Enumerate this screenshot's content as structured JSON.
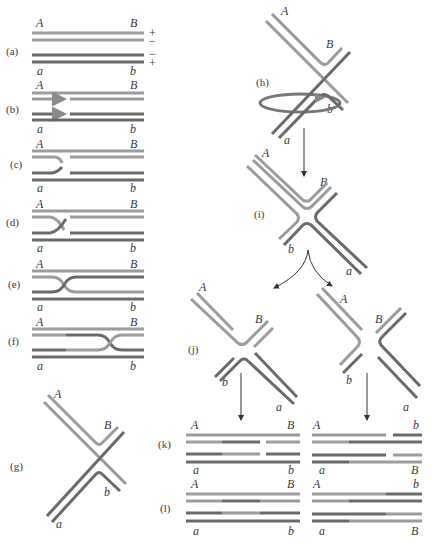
{
  "figure": {
    "colors": {
      "light_strand": "#9c9c9c",
      "dark_strand": "#6a6a6a",
      "arrow": "#333333",
      "background": "#ffffff"
    },
    "panels": {
      "a": {
        "label": "(a)",
        "top_left": "A",
        "top_right": "B",
        "bottom_left": "a",
        "bottom_right": "b",
        "signs": [
          "+",
          "−",
          "−",
          "+"
        ]
      },
      "b": {
        "label": "(b)",
        "top_left": "A",
        "top_right": "B",
        "bottom_left": "a",
        "bottom_right": "b"
      },
      "c": {
        "label": "(c)",
        "top_left": "A",
        "top_right": "B",
        "bottom_left": "a",
        "bottom_right": "b"
      },
      "d": {
        "label": "(d)",
        "top_left": "A",
        "top_right": "B",
        "bottom_left": "a",
        "bottom_right": "b"
      },
      "e": {
        "label": "(e)",
        "top_left": "A",
        "top_right": "B",
        "bottom_left": "a",
        "bottom_right": "b"
      },
      "f": {
        "label": "(f)",
        "top_left": "A",
        "top_right": "B",
        "bottom_left": "a",
        "bottom_right": "b"
      },
      "g": {
        "label": "(g)",
        "A": "A",
        "B": "B",
        "a": "a",
        "b": "b"
      },
      "h": {
        "label": "(h)",
        "A": "A",
        "B": "B",
        "a": "a",
        "b": "b"
      },
      "i": {
        "label": "(i)",
        "A": "A",
        "B": "B",
        "a": "a",
        "b": "b"
      },
      "j": {
        "label": "(j)",
        "left": {
          "A": "A",
          "B": "B",
          "a": "a",
          "b": "b"
        },
        "right": {
          "A": "A",
          "B": "B",
          "a": "a",
          "b": "b"
        }
      },
      "k": {
        "label": "(k)",
        "left": {
          "top_left": "A",
          "top_right": "B",
          "bottom_left": "a",
          "bottom_right": "b"
        },
        "right": {
          "top_left": "A",
          "top_right": "b",
          "bottom_left": "a",
          "bottom_right": "B"
        }
      },
      "l": {
        "label": "(l)",
        "left": {
          "top_left": "A",
          "top_right": "B",
          "bottom_left": "a",
          "bottom_right": "b"
        },
        "right": {
          "top_left": "A",
          "top_right": "b",
          "bottom_left": "a",
          "bottom_right": "B"
        }
      }
    }
  }
}
